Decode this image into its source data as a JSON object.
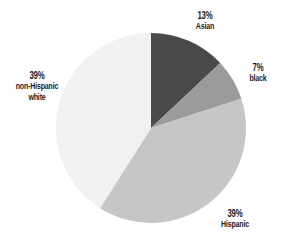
{
  "chart_data": {
    "type": "pie",
    "title": "",
    "start_angle_deg": 0,
    "direction": "clockwise",
    "categories": [
      "Asian",
      "black",
      "Hispanic",
      "non-Hispanic white"
    ],
    "values": [
      13,
      7,
      39,
      39
    ],
    "labels": [
      {
        "pct": "13%",
        "name": "Asian"
      },
      {
        "pct": "7%",
        "name": "black"
      },
      {
        "pct": "39%",
        "name": "Hispanic"
      },
      {
        "pct": "39%",
        "name": "non-Hispanic white"
      }
    ],
    "colors": [
      "#4a4a4a",
      "#9b9b9b",
      "#c6c6c6",
      "#f1f1f1"
    ],
    "legend": "none (direct labels)"
  },
  "labels": {
    "asian": {
      "pct": "13%",
      "name": "Asian"
    },
    "black": {
      "pct": "7%",
      "name": "black"
    },
    "hispanic": {
      "pct": "39%",
      "name": "Hispanic"
    },
    "white": {
      "pct": "39%",
      "name_line1": "non-Hispanic",
      "name_line2": "white"
    }
  }
}
